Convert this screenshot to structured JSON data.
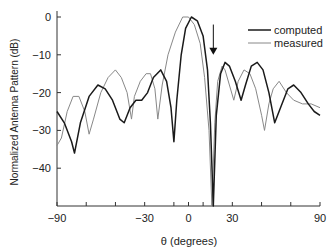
{
  "chart_data": {
    "type": "line",
    "title": "",
    "xlabel": "θ (degrees)",
    "ylabel": "Normalized Antenna Pattern (dB)",
    "xlim": [
      -90,
      90
    ],
    "ylim": [
      -50,
      0
    ],
    "x_ticks": [
      -90,
      -30,
      0,
      30,
      90
    ],
    "x_minor_ticks": [
      -70,
      -50,
      -10,
      10,
      50,
      70
    ],
    "y_ticks": [
      0,
      -10,
      -20,
      -30,
      -40
    ],
    "grid": false,
    "legend_position": "upper right",
    "annotations": [
      {
        "type": "arrow",
        "x": 17,
        "y_from": -2,
        "y_to": -10,
        "direction": "down"
      }
    ],
    "series": [
      {
        "name": "computed",
        "color": "#1a1a1a",
        "points": [
          [
            -90,
            -25
          ],
          [
            -85,
            -28
          ],
          [
            -80,
            -33
          ],
          [
            -78,
            -36
          ],
          [
            -74,
            -28
          ],
          [
            -68,
            -21
          ],
          [
            -62,
            -18
          ],
          [
            -57,
            -19
          ],
          [
            -52,
            -22
          ],
          [
            -47,
            -27
          ],
          [
            -44,
            -28
          ],
          [
            -40,
            -24
          ],
          [
            -36,
            -22
          ],
          [
            -32,
            -22
          ],
          [
            -28,
            -20
          ],
          [
            -24,
            -16
          ],
          [
            -19,
            -14
          ],
          [
            -15,
            -17
          ],
          [
            -12,
            -24
          ],
          [
            -10,
            -33
          ],
          [
            -8,
            -22
          ],
          [
            -5,
            -10
          ],
          [
            -2,
            -3
          ],
          [
            2,
            0
          ],
          [
            6,
            -1
          ],
          [
            10,
            -5
          ],
          [
            13,
            -14
          ],
          [
            15,
            -28
          ],
          [
            17,
            -50
          ],
          [
            19,
            -26
          ],
          [
            22,
            -15
          ],
          [
            25,
            -12
          ],
          [
            28,
            -13
          ],
          [
            32,
            -17
          ],
          [
            36,
            -22
          ],
          [
            39,
            -18
          ],
          [
            43,
            -13
          ],
          [
            47,
            -12
          ],
          [
            51,
            -14
          ],
          [
            55,
            -20
          ],
          [
            59,
            -28
          ],
          [
            63,
            -24
          ],
          [
            68,
            -19
          ],
          [
            72,
            -18
          ],
          [
            77,
            -20
          ],
          [
            82,
            -23
          ],
          [
            86,
            -25
          ],
          [
            90,
            -26
          ]
        ]
      },
      {
        "name": "measured",
        "color": "#888888",
        "points": [
          [
            -90,
            -34
          ],
          [
            -87,
            -32
          ],
          [
            -83,
            -25
          ],
          [
            -79,
            -21
          ],
          [
            -75,
            -21
          ],
          [
            -71,
            -25
          ],
          [
            -68,
            -31
          ],
          [
            -65,
            -27
          ],
          [
            -60,
            -20
          ],
          [
            -55,
            -16
          ],
          [
            -50,
            -14
          ],
          [
            -46,
            -16
          ],
          [
            -42,
            -20
          ],
          [
            -39,
            -27
          ],
          [
            -37,
            -21
          ],
          [
            -33,
            -17
          ],
          [
            -29,
            -15
          ],
          [
            -26,
            -15
          ],
          [
            -23,
            -19
          ],
          [
            -21,
            -27
          ],
          [
            -18,
            -18
          ],
          [
            -14,
            -10
          ],
          [
            -9,
            -4
          ],
          [
            -4,
            0
          ],
          [
            0,
            0
          ],
          [
            4,
            -2
          ],
          [
            8,
            -7
          ],
          [
            11,
            -16
          ],
          [
            14,
            -30
          ],
          [
            16,
            -50
          ],
          [
            18,
            -28
          ],
          [
            20,
            -17
          ],
          [
            23,
            -13
          ],
          [
            25,
            -14
          ],
          [
            28,
            -18
          ],
          [
            31,
            -22
          ],
          [
            34,
            -17
          ],
          [
            38,
            -14
          ],
          [
            42,
            -15
          ],
          [
            46,
            -19
          ],
          [
            50,
            -26
          ],
          [
            52,
            -30
          ],
          [
            55,
            -23
          ],
          [
            58,
            -19
          ],
          [
            62,
            -17
          ],
          [
            67,
            -20
          ],
          [
            72,
            -22
          ],
          [
            78,
            -23
          ],
          [
            84,
            -23
          ],
          [
            90,
            -24
          ]
        ]
      }
    ]
  }
}
